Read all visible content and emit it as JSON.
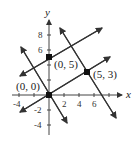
{
  "diagram": {
    "axes": {
      "x_label": "x",
      "y_label": "y",
      "x_ticks": [
        "-4",
        "2",
        "4",
        "6"
      ],
      "y_ticks": [
        "8",
        "6",
        "-2",
        "-4"
      ]
    },
    "points": [
      {
        "label": "(0, 0)",
        "x": 0,
        "y": 0
      },
      {
        "label": "(0, 5)",
        "x": 0,
        "y": 5
      },
      {
        "label": "(5, 3)",
        "x": 5,
        "y": 3
      }
    ],
    "lines": [
      {
        "name": "line-through-origin-and-5-3",
        "slope": "3/5"
      },
      {
        "name": "line-through-0-5",
        "slope": "3/5"
      },
      {
        "name": "line-through-origin-perpendicular",
        "slope": "-5/3"
      },
      {
        "name": "line-through-5-3-perpendicular",
        "slope": "-5/3"
      }
    ]
  }
}
